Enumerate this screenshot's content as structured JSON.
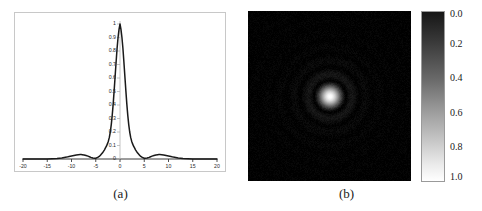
{
  "figure": {
    "panels": [
      {
        "id": "a",
        "caption": "(a)",
        "type": "line-plot"
      },
      {
        "id": "b",
        "caption": "(b)",
        "type": "grayscale-image"
      }
    ]
  },
  "chart_data": [
    {
      "type": "line",
      "title": "",
      "xlabel": "",
      "ylabel": "",
      "xlim": [
        -20,
        20
      ],
      "ylim": [
        0,
        1
      ],
      "grid": false,
      "legend": null,
      "xticks": [
        "-20",
        "-15",
        "-10",
        "-5",
        "0",
        "5",
        "10",
        "15",
        "20"
      ],
      "xtick_values": [
        -20,
        -15,
        -10,
        -5,
        0,
        5,
        10,
        15,
        20
      ],
      "yticks": [
        "1",
        "0.9",
        "0.8",
        "0.7",
        "0.6",
        "0.5",
        "0.4",
        "0.3",
        "0.2",
        "0.1",
        "0"
      ],
      "ytick_values": [
        1,
        0.9,
        0.8,
        0.7,
        0.6,
        0.5,
        0.4,
        0.3,
        0.2,
        0.1,
        0
      ],
      "series": [
        {
          "name": "point-spread-function-profile",
          "color": "#1a1a1a",
          "x": [
            -20,
            -19,
            -18,
            -17,
            -16,
            -15,
            -14,
            -13,
            -12,
            -11.5,
            -11,
            -10.5,
            -10,
            -9.5,
            -9,
            -8.6,
            -8.2,
            -8,
            -7.8,
            -7.4,
            -7,
            -6.6,
            -6.2,
            -6,
            -5.6,
            -5.2,
            -5,
            -4.6,
            -4.2,
            -4,
            -3.6,
            -3.2,
            -3,
            -2.8,
            -2.6,
            -2.4,
            -2.2,
            -2,
            -1.8,
            -1.6,
            -1.4,
            -1.2,
            -1,
            -0.8,
            -0.6,
            -0.4,
            -0.2,
            0,
            0.2,
            0.4,
            0.6,
            0.8,
            1,
            1.2,
            1.4,
            1.6,
            1.8,
            2,
            2.2,
            2.4,
            2.6,
            2.8,
            3,
            3.2,
            3.6,
            4,
            4.2,
            4.6,
            5,
            5.2,
            5.6,
            6,
            6.2,
            6.6,
            7,
            7.4,
            7.8,
            8,
            8.2,
            8.6,
            9,
            9.5,
            10,
            10.5,
            11,
            11.5,
            12,
            13,
            14,
            15,
            16,
            17,
            18,
            19,
            20
          ],
          "y": [
            0.0,
            0.0,
            0.0,
            0.0,
            0.0,
            0.0,
            0.002,
            0.004,
            0.008,
            0.011,
            0.014,
            0.018,
            0.022,
            0.026,
            0.03,
            0.032,
            0.033,
            0.033,
            0.032,
            0.03,
            0.026,
            0.021,
            0.015,
            0.012,
            0.008,
            0.005,
            0.006,
            0.012,
            0.022,
            0.029,
            0.046,
            0.068,
            0.082,
            0.095,
            0.112,
            0.132,
            0.16,
            0.2,
            0.255,
            0.325,
            0.41,
            0.51,
            0.615,
            0.72,
            0.82,
            0.9,
            0.96,
            1.0,
            0.96,
            0.9,
            0.82,
            0.72,
            0.615,
            0.51,
            0.41,
            0.325,
            0.255,
            0.2,
            0.16,
            0.132,
            0.112,
            0.095,
            0.082,
            0.068,
            0.046,
            0.029,
            0.022,
            0.012,
            0.006,
            0.005,
            0.008,
            0.012,
            0.015,
            0.021,
            0.026,
            0.03,
            0.032,
            0.033,
            0.033,
            0.032,
            0.03,
            0.026,
            0.022,
            0.018,
            0.014,
            0.011,
            0.008,
            0.004,
            0.002,
            0.0,
            0.0,
            0.0,
            0.0,
            0.0,
            0.0
          ]
        }
      ]
    },
    {
      "type": "heatmap",
      "title": "",
      "colorbar": {
        "ticks": [
          "0.0",
          "0.2",
          "0.4",
          "0.6",
          "0.8",
          "1.0"
        ],
        "tick_values": [
          0.0,
          0.2,
          0.4,
          0.6,
          0.8,
          1.0
        ],
        "min_label": "0.0",
        "max_label": "1.0",
        "orientation": "vertical",
        "colormap": "gray-inverted",
        "low_color": "#000000",
        "high_color": "#ffffff"
      },
      "description": "two-dimensional point spread function with bright central core and concentric rings",
      "xlim": [
        -20,
        20
      ],
      "ylim": [
        -20,
        20
      ],
      "grid": false
    }
  ]
}
